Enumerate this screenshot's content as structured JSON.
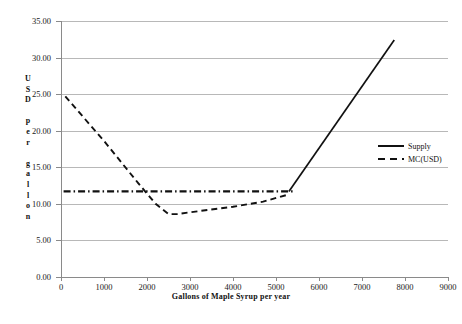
{
  "chart_data": {
    "type": "line",
    "title": "",
    "xlabel": "Gallons of  Maple Syrup per year",
    "ylabel_chars": [
      "U",
      "S",
      "D",
      "",
      "p",
      "e",
      "r",
      "",
      "g",
      "a",
      "l",
      "l",
      "o",
      "n"
    ],
    "ylabel": "USD per gallon",
    "xlim": [
      0,
      9000
    ],
    "ylim": [
      0,
      35
    ],
    "xticks": [
      "0",
      "1000",
      "2000",
      "3000",
      "4000",
      "5000",
      "6000",
      "7000",
      "8000",
      "9000"
    ],
    "xtick_values": [
      0,
      1000,
      2000,
      3000,
      4000,
      5000,
      6000,
      7000,
      8000,
      9000
    ],
    "yticks": [
      "0.00",
      "5.00",
      "10.00",
      "15.00",
      "20.00",
      "25.00",
      "30.00",
      "35.00"
    ],
    "ytick_values": [
      0,
      5,
      10,
      15,
      20,
      25,
      30,
      35
    ],
    "grid": "horizontal",
    "legend_position": "right",
    "series": [
      {
        "name": "Supply",
        "style": "solid",
        "color": "#111111",
        "points": [
          [
            5300,
            11.7
          ],
          [
            7750,
            32.4
          ]
        ]
      },
      {
        "name": "MC(USD)",
        "style": "dashed",
        "color": "#111111",
        "points": [
          [
            100,
            24.7
          ],
          [
            1000,
            18.6
          ],
          [
            1800,
            12.8
          ],
          [
            2200,
            10.0
          ],
          [
            2500,
            8.6
          ],
          [
            2700,
            8.6
          ],
          [
            3200,
            9.0
          ],
          [
            4000,
            9.6
          ],
          [
            4700,
            10.3
          ],
          [
            5300,
            11.3
          ]
        ]
      },
      {
        "name": "price-line",
        "style": "dash-dot",
        "color": "#111111",
        "points": [
          [
            60,
            11.7
          ],
          [
            5400,
            11.7
          ]
        ]
      }
    ]
  },
  "legend": {
    "items": [
      {
        "label": "Supply",
        "style": "solid"
      },
      {
        "label": "MC(USD)",
        "style": "dashed"
      }
    ]
  }
}
